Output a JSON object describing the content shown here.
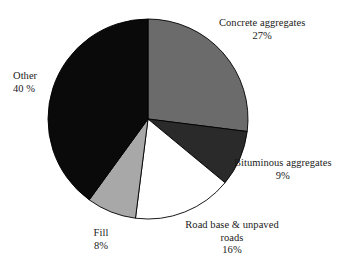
{
  "chart_data": {
    "type": "pie",
    "title": "",
    "subtitle": "",
    "xlabel": "",
    "ylabel": "",
    "legend_position": "none",
    "grid": false,
    "units": "percent",
    "start_angle_deg": 0,
    "direction": "clockwise",
    "categories": [
      "Concrete aggregates",
      "Bituminous aggregates",
      "Road base & unpaved roads",
      "Fill",
      "Other"
    ],
    "values": [
      27,
      9,
      16,
      8,
      40
    ],
    "colors": [
      "#6b6b6b",
      "#2a2a2a",
      "#ffffff",
      "#a8a8a8",
      "#0a0a0a"
    ],
    "slices": [
      {
        "name": "Concrete aggregates",
        "value": 27,
        "value_label": "27%",
        "color": "#6b6b6b",
        "start_deg": 0,
        "end_deg": 97.2
      },
      {
        "name": "Bituminous aggregates",
        "value": 9,
        "value_label": "9%",
        "color": "#2a2a2a",
        "start_deg": 97.2,
        "end_deg": 129.6
      },
      {
        "name": "Road base & unpaved roads",
        "value": 16,
        "value_label": "16%",
        "color": "#ffffff",
        "start_deg": 129.6,
        "end_deg": 187.2
      },
      {
        "name": "Fill",
        "value": 8,
        "value_label": "8%",
        "color": "#a8a8a8",
        "start_deg": 187.2,
        "end_deg": 216.0
      },
      {
        "name": "Other",
        "value": 40,
        "value_label": "40 %",
        "color": "#0a0a0a",
        "start_deg": 216.0,
        "end_deg": 360.0
      }
    ]
  },
  "labels": {
    "concrete": {
      "name": "Concrete aggregates",
      "value": "27%"
    },
    "bituminous": {
      "name": "Bituminous aggregates",
      "value": "9%"
    },
    "roadbase": {
      "name": "Road base & unpaved roads",
      "value": "16%"
    },
    "fill": {
      "name": "Fill",
      "value": "8%"
    },
    "other": {
      "name": "Other",
      "value": "40 %"
    }
  },
  "geometry": {
    "center_x": 148,
    "center_y": 119,
    "radius": 100,
    "outline_color": "#000000"
  }
}
